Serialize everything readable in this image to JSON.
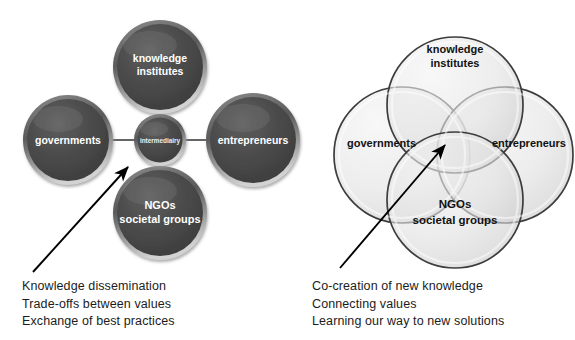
{
  "figure": {
    "background_color": "#ffffff",
    "dark_circle_color": "#4a4a4a",
    "dark_circle_text_color": "#ffffff",
    "venn_fill_color": "#d9d9d9",
    "venn_stroke_color": "#3d3d3d",
    "venn_text_color": "#111111",
    "arrow_color": "#000000",
    "connector_color": "#555555"
  },
  "left_diagram": {
    "name": "intermediary-hub-diagram",
    "center": {
      "label": "intermediairy",
      "cx": 160,
      "cy": 140,
      "r": 26
    },
    "nodes": [
      {
        "id": "knowledge-institutes",
        "lines": [
          "knowledge",
          "institutes"
        ],
        "cx": 160,
        "cy": 67,
        "r": 47
      },
      {
        "id": "governments",
        "lines": [
          "governments"
        ],
        "cx": 68,
        "cy": 140,
        "r": 45
      },
      {
        "id": "entrepreneurs",
        "lines": [
          "entrepreneurs"
        ],
        "cx": 253,
        "cy": 140,
        "r": 47
      },
      {
        "id": "ngos-societal-groups",
        "lines": [
          "NGOs",
          "societal groups"
        ],
        "cx": 160,
        "cy": 213,
        "r": 47
      }
    ],
    "arrow": {
      "x1": 33,
      "y1": 272,
      "x2": 130,
      "y2": 165
    },
    "caption": [
      "Knowledge dissemination",
      "Trade-offs between values",
      "Exchange of best practices"
    ]
  },
  "right_diagram": {
    "name": "co-creation-venn-diagram",
    "circles": [
      {
        "id": "knowledge-institutes",
        "lines": [
          "knowledge",
          "institutes"
        ],
        "cx": 455,
        "cy": 105,
        "r": 68,
        "label_x": 455,
        "label_y": 55
      },
      {
        "id": "governments",
        "lines": [
          "governments"
        ],
        "cx": 402,
        "cy": 155,
        "r": 68,
        "label_x": 392,
        "label_y": 143
      },
      {
        "id": "entrepreneurs",
        "lines": [
          "entrepreneurs"
        ],
        "cx": 505,
        "cy": 155,
        "r": 68,
        "label_x": 520,
        "label_y": 143
      },
      {
        "id": "ngos-societal-groups",
        "lines": [
          "NGOs",
          "societal groups"
        ],
        "cx": 455,
        "cy": 200,
        "r": 68,
        "label_x": 455,
        "label_y": 209
      }
    ],
    "arrow": {
      "x1": 340,
      "y1": 268,
      "x2": 447,
      "y2": 143
    },
    "caption": [
      "Co-creation of new knowledge",
      "Connecting values",
      "Learning our way to new solutions"
    ]
  }
}
